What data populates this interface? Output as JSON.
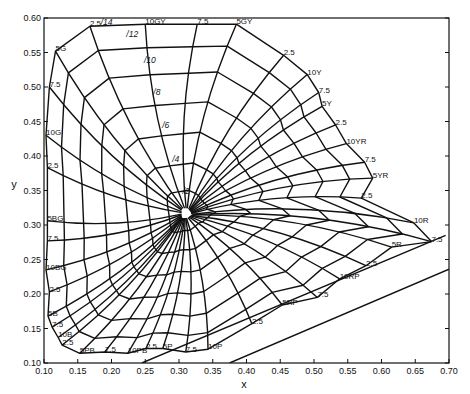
{
  "chart_data": {
    "type": "line",
    "title": "",
    "xlabel": "x",
    "ylabel": "y",
    "xlim": [
      0.1,
      0.7
    ],
    "ylim": [
      0.1,
      0.6
    ],
    "grid": false,
    "x_ticks": [
      "0.10",
      "0.15",
      "0.20",
      "0.25",
      "0.30",
      "0.35",
      "0.40",
      "0.45",
      "0.50",
      "0.55",
      "0.60",
      "0.65",
      "0.70"
    ],
    "y_ticks": [
      "0.10",
      "0.15",
      "0.20",
      "0.25",
      "0.30",
      "0.35",
      "0.40",
      "0.45",
      "0.50",
      "0.55",
      "0.60"
    ],
    "white_point": {
      "x": 0.31,
      "y": 0.316
    },
    "chroma_labels": [
      {
        "text": "/2",
        "x": 0.305,
        "y": 0.345
      },
      {
        "text": "/4",
        "x": 0.29,
        "y": 0.392
      },
      {
        "text": "/6",
        "x": 0.275,
        "y": 0.44
      },
      {
        "text": "/8",
        "x": 0.262,
        "y": 0.488
      },
      {
        "text": "/10",
        "x": 0.248,
        "y": 0.535
      },
      {
        "text": "/12",
        "x": 0.222,
        "y": 0.573
      },
      {
        "text": "/14",
        "x": 0.184,
        "y": 0.59
      }
    ],
    "hue_labels": [
      {
        "text": "2.5",
        "x": 0.168,
        "y": 0.588
      },
      {
        "text": "10GY",
        "x": 0.25,
        "y": 0.591
      },
      {
        "text": "7.5",
        "x": 0.327,
        "y": 0.591
      },
      {
        "text": "5GY",
        "x": 0.385,
        "y": 0.591
      },
      {
        "text": "2.5",
        "x": 0.455,
        "y": 0.546
      },
      {
        "text": "10Y",
        "x": 0.49,
        "y": 0.518
      },
      {
        "text": "7.5",
        "x": 0.507,
        "y": 0.492
      },
      {
        "text": "5Y",
        "x": 0.512,
        "y": 0.472
      },
      {
        "text": "2.5",
        "x": 0.532,
        "y": 0.445
      },
      {
        "text": "10YR",
        "x": 0.548,
        "y": 0.418
      },
      {
        "text": "7.5",
        "x": 0.575,
        "y": 0.391
      },
      {
        "text": "5YR",
        "x": 0.587,
        "y": 0.368
      },
      {
        "text": "2.5",
        "x": 0.57,
        "y": 0.339
      },
      {
        "text": "10R",
        "x": 0.648,
        "y": 0.303
      },
      {
        "text": "7.5",
        "x": 0.674,
        "y": 0.276
      },
      {
        "text": "5R",
        "x": 0.615,
        "y": 0.268
      },
      {
        "text": "2.5",
        "x": 0.577,
        "y": 0.241
      },
      {
        "text": "10RP",
        "x": 0.538,
        "y": 0.222
      },
      {
        "text": "7.5",
        "x": 0.505,
        "y": 0.195
      },
      {
        "text": "5RP",
        "x": 0.453,
        "y": 0.184
      },
      {
        "text": "2.5",
        "x": 0.408,
        "y": 0.157
      },
      {
        "text": "10P",
        "x": 0.343,
        "y": 0.12
      },
      {
        "text": "7.5",
        "x": 0.31,
        "y": 0.116
      },
      {
        "text": "5P",
        "x": 0.276,
        "y": 0.121
      },
      {
        "text": "2.5",
        "x": 0.251,
        "y": 0.121
      },
      {
        "text": "10PB",
        "x": 0.224,
        "y": 0.114
      },
      {
        "text": "7.5",
        "x": 0.19,
        "y": 0.116
      },
      {
        "text": "5PB",
        "x": 0.153,
        "y": 0.114
      },
      {
        "text": "2.5",
        "x": 0.127,
        "y": 0.126
      },
      {
        "text": "10B",
        "x": 0.121,
        "y": 0.137
      },
      {
        "text": "7.5",
        "x": 0.112,
        "y": 0.152
      },
      {
        "text": "5B",
        "x": 0.106,
        "y": 0.168
      },
      {
        "text": "2.5",
        "x": 0.108,
        "y": 0.203
      },
      {
        "text": "10BG",
        "x": 0.103,
        "y": 0.235
      },
      {
        "text": "7.5",
        "x": 0.105,
        "y": 0.277
      },
      {
        "text": "5BG",
        "x": 0.105,
        "y": 0.306
      },
      {
        "text": "2.5",
        "x": 0.105,
        "y": 0.383
      },
      {
        "text": "10G",
        "x": 0.103,
        "y": 0.43
      },
      {
        "text": "7.5",
        "x": 0.108,
        "y": 0.5
      },
      {
        "text": "5G",
        "x": 0.117,
        "y": 0.552
      }
    ]
  }
}
